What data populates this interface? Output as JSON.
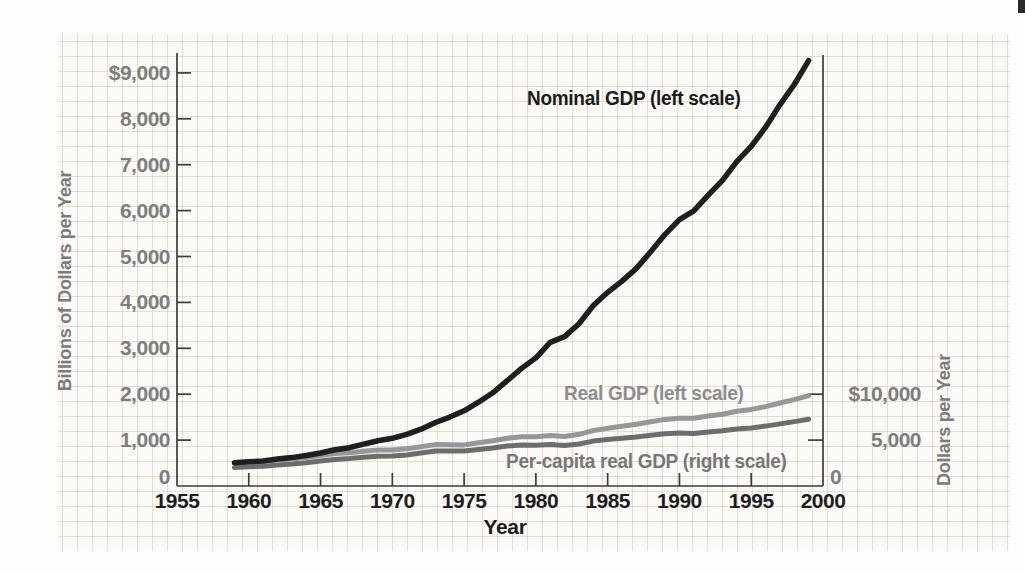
{
  "figure": {
    "page_background": "#fdfdfb",
    "paper_tint": "#fbfaf7",
    "grid_color": "#cdc7ba",
    "corner_mark_color": "#2b2b2b",
    "axis_color": "#3b3b3b",
    "y_tick_label_color": "#7e7e7e",
    "x_tick_label_color": "#1d1d1d"
  },
  "chart_data": {
    "type": "line",
    "title": "",
    "xlabel": "Year",
    "ylabel_left": "Billions of Dollars per Year",
    "ylabel_right": "Dollars per Year",
    "x_range": [
      1955,
      2000
    ],
    "ylim_left": [
      0,
      9400
    ],
    "ylim_right_labeled": [
      0,
      10000
    ],
    "right_scale_units_per_left_unit": 5,
    "grid": "faint graph-paper grid, not aligned to axis ticks",
    "legend_position": "inline labels beside lines",
    "x_tick_labels": [
      "1955",
      "1960",
      "1965",
      "1970",
      "1975",
      "1980",
      "1985",
      "1990",
      "1995",
      "2000"
    ],
    "left_ticks": [
      {
        "value": 9000,
        "label": "$9,000"
      },
      {
        "value": 8000,
        "label": "8,000"
      },
      {
        "value": 7000,
        "label": "7,000"
      },
      {
        "value": 6000,
        "label": "6,000"
      },
      {
        "value": 5000,
        "label": "5,000"
      },
      {
        "value": 4000,
        "label": "4,000"
      },
      {
        "value": 3000,
        "label": "3,000"
      },
      {
        "value": 2000,
        "label": "2,000"
      },
      {
        "value": 1000,
        "label": "1,000"
      },
      {
        "value": 0,
        "label": "0"
      }
    ],
    "right_ticks": [
      {
        "value": 10000,
        "label": "$10,000"
      },
      {
        "value": 5000,
        "label": "5,000"
      },
      {
        "value": 0,
        "label": "0"
      }
    ],
    "years": [
      1959,
      1960,
      1961,
      1962,
      1963,
      1964,
      1965,
      1966,
      1967,
      1968,
      1969,
      1970,
      1971,
      1972,
      1973,
      1974,
      1975,
      1976,
      1977,
      1978,
      1979,
      1980,
      1981,
      1982,
      1983,
      1984,
      1985,
      1986,
      1987,
      1988,
      1989,
      1990,
      1991,
      1992,
      1993,
      1994,
      1995,
      1996,
      1997,
      1998,
      1999
    ],
    "series": [
      {
        "name": "nominal_gdp",
        "label": "Nominal GDP (left scale)",
        "scale": "left",
        "color": "#1f1f1f",
        "label_color": "#1b1b1b",
        "stroke_width": 5.5,
        "values": [
          507,
          527,
          545,
          586,
          618,
          664,
          720,
          789,
          834,
          911,
          985,
          1040,
          1127,
          1238,
          1383,
          1500,
          1638,
          1825,
          2031,
          2295,
          2563,
          2790,
          3128,
          3255,
          3537,
          3933,
          4220,
          4463,
          4740,
          5104,
          5484,
          5803,
          5996,
          6338,
          6657,
          7072,
          7398,
          7817,
          8304,
          8747,
          9268
        ]
      },
      {
        "name": "real_gdp",
        "label": "Real GDP (left scale)",
        "scale": "left",
        "color": "#979797",
        "label_color": "#8d8d8d",
        "stroke_width": 5,
        "values": [
          507,
          520,
          532,
          564,
          589,
          623,
          663,
          706,
          724,
          759,
          782,
          783,
          810,
          853,
          902,
          897,
          895,
          943,
          987,
          1042,
          1074,
          1072,
          1099,
          1078,
          1127,
          1208,
          1257,
          1301,
          1345,
          1400,
          1450,
          1477,
          1475,
          1524,
          1565,
          1628,
          1668,
          1730,
          1808,
          1883,
          1967
        ]
      },
      {
        "name": "per_capita_real_gdp",
        "label": "Per-capita real GDP (right scale)",
        "scale": "right",
        "color": "#6d6d6d",
        "label_color": "#777777",
        "stroke_width": 5,
        "values": [
          2030,
          2090,
          2150,
          2280,
          2390,
          2540,
          2710,
          2900,
          2990,
          3140,
          3250,
          3270,
          3390,
          3590,
          3810,
          3800,
          3800,
          3990,
          4150,
          4360,
          4470,
          4430,
          4520,
          4410,
          4580,
          4890,
          5050,
          5200,
          5350,
          5530,
          5700,
          5770,
          5730,
          5880,
          6010,
          6210,
          6330,
          6520,
          6770,
          7010,
          7280
        ]
      }
    ]
  }
}
